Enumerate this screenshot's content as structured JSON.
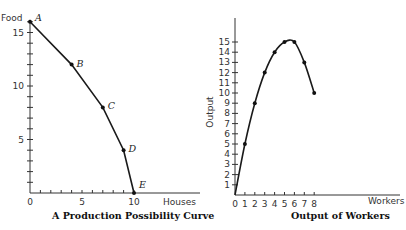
{
  "chart_data": [
    {
      "type": "line",
      "title": "A Production Possibility Curve",
      "xlabel": "Houses",
      "ylabel": "Food",
      "xlim": [
        0,
        10
      ],
      "ylim": [
        0,
        16
      ],
      "x_ticks": [
        0,
        5,
        10
      ],
      "y_ticks": [
        5,
        10,
        15
      ],
      "grid": false,
      "points": [
        {
          "label": "A",
          "x": 0,
          "y": 16
        },
        {
          "label": "B",
          "x": 4,
          "y": 12
        },
        {
          "label": "C",
          "x": 7,
          "y": 8
        },
        {
          "label": "D",
          "x": 9,
          "y": 4
        },
        {
          "label": "E",
          "x": 10,
          "y": 0
        }
      ]
    },
    {
      "type": "line",
      "title": "Output of Workers",
      "xlabel": "Workers",
      "ylabel": "Output",
      "xlim": [
        0,
        8
      ],
      "ylim": [
        0,
        15
      ],
      "x_ticks": [
        0,
        1,
        2,
        3,
        4,
        5,
        6,
        7,
        8
      ],
      "y_ticks": [
        1,
        2,
        3,
        4,
        5,
        6,
        7,
        8,
        9,
        10,
        11,
        12,
        13,
        14,
        15
      ],
      "grid": false,
      "x": [
        0,
        1,
        2,
        3,
        4,
        5,
        6,
        7,
        8
      ],
      "values": [
        0,
        5,
        9,
        12,
        14,
        15,
        15,
        13,
        10
      ]
    }
  ]
}
